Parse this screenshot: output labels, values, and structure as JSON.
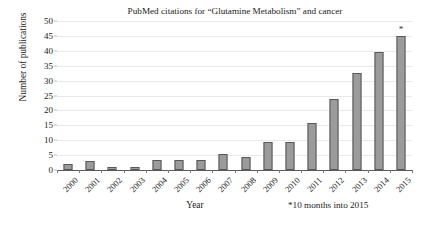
{
  "chart_data": {
    "type": "bar",
    "title": "PubMed citations for “Glutamine Metabolism” and cancer",
    "xlabel": "Year",
    "ylabel": "Number of publications",
    "ylim": [
      0,
      50
    ],
    "ytick_step": 5,
    "yticks": [
      0,
      5,
      10,
      15,
      20,
      25,
      30,
      35,
      40,
      45,
      50
    ],
    "grid": true,
    "legend": "none",
    "categories": [
      "2000",
      "2001",
      "2002",
      "2003",
      "2004",
      "2005",
      "2006",
      "2007",
      "2008",
      "2009",
      "2010",
      "2011",
      "2012",
      "2013",
      "2014",
      "2015"
    ],
    "values": [
      2,
      3,
      1,
      1,
      3.3,
      3.3,
      3.3,
      5.3,
      4.5,
      9.5,
      9.5,
      15.7,
      23.8,
      32.7,
      39.6,
      45
    ],
    "annotations": [
      {
        "category": "2015",
        "text": "*",
        "position": "above-bar"
      }
    ],
    "footnote": "*10 months into 2015",
    "bar_fill_color": "#9b9b9b",
    "bar_edge_color": "#585858",
    "grid_color": "#e9e9e9",
    "axis_color": "#5a5a5a",
    "text_color": "#222222"
  }
}
